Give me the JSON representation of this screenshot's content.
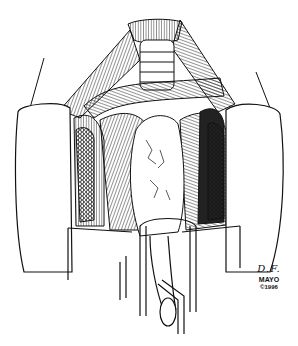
{
  "figure": {
    "type": "medical-line-illustration",
    "colors": {
      "ink": "#111111",
      "background": "#ffffff"
    }
  },
  "signature": {
    "initials": "D.F.",
    "organization": "MAYO",
    "copyright": "©1996"
  }
}
